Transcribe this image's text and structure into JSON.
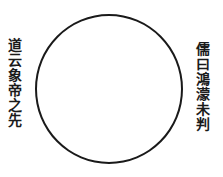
{
  "diagram": {
    "shape": "circle",
    "left_text": "道云象帝之先",
    "right_text": "儒曰鴻濛未判",
    "colors": {
      "ink": "#1a1a1a",
      "background": "#ffffff"
    }
  }
}
